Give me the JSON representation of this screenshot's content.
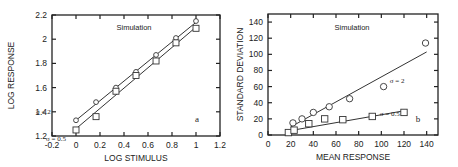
{
  "chart_data": [
    {
      "type": "scatter",
      "panel_label": "a",
      "annotation": "Simulation",
      "xlabel": "LOG STIMULUS",
      "ylabel": "LOG RESPONSE",
      "xlim": [
        -0.2,
        1.2
      ],
      "ylim": [
        1.2,
        2.2
      ],
      "xticks": [
        "-0.2",
        "0",
        "0.2",
        "0.4",
        "0.6",
        "0.8",
        "1",
        "1.2"
      ],
      "yticks": [
        "1.2",
        "1.4",
        "1.6",
        "1.8",
        "2",
        "2.2"
      ],
      "grid": false,
      "series": [
        {
          "name": "σ = 2",
          "marker": "circle",
          "x": [
            0,
            0.167,
            0.333,
            0.5,
            0.667,
            0.833,
            1
          ],
          "y": [
            1.33,
            1.48,
            1.6,
            1.73,
            1.87,
            2.01,
            2.15
          ],
          "fit_line": [
            [
              0,
              1.33
            ],
            [
              1,
              2.14
            ]
          ]
        },
        {
          "name": "σ = 0.5",
          "marker": "square",
          "x": [
            0,
            0.167,
            0.333,
            0.5,
            0.667,
            0.833,
            1
          ],
          "y": [
            1.25,
            1.36,
            1.57,
            1.7,
            1.82,
            1.97,
            2.09
          ],
          "fit_line": [
            [
              0,
              1.26
            ],
            [
              1,
              2.1
            ]
          ]
        }
      ]
    },
    {
      "type": "scatter",
      "panel_label": "b",
      "annotation": "Simulation",
      "xlabel": "MEAN RESPONSE",
      "ylabel": "STANDARD DEVIATION",
      "xlim": [
        0,
        150
      ],
      "ylim": [
        0,
        150
      ],
      "xticks": [
        "0",
        "20",
        "40",
        "60",
        "80",
        "100",
        "120",
        "140"
      ],
      "yticks": [
        "0",
        "20",
        "40",
        "60",
        "80",
        "100",
        "120",
        "140"
      ],
      "grid": false,
      "series": [
        {
          "name": "σ = 2",
          "marker": "circle",
          "x": [
            22,
            30,
            40,
            54,
            72,
            102,
            139
          ],
          "y": [
            15,
            20,
            28,
            35,
            45,
            60,
            114
          ],
          "fit_line": [
            [
              20,
              10
            ],
            [
              140,
              103
            ]
          ]
        },
        {
          "name": "σ = 0.5",
          "marker": "square",
          "x": [
            18,
            23,
            36,
            50,
            66,
            92,
            120
          ],
          "y": [
            3,
            6,
            14,
            20,
            19,
            23,
            28
          ],
          "fit_line": [
            [
              18,
              5
            ],
            [
              120,
              30
            ]
          ]
        }
      ]
    }
  ]
}
